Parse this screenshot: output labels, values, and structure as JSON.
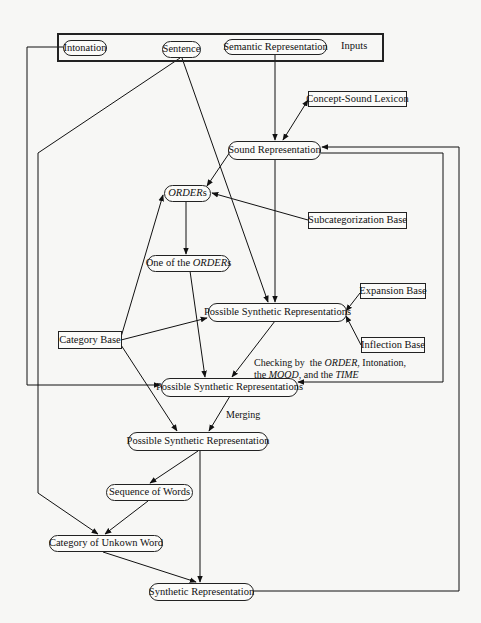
{
  "inputs_frame": {
    "label": "Inputs",
    "items": [
      "Intonation",
      "Sentence",
      "Semantic Representation"
    ]
  },
  "nodes": {
    "intonation": "Intonation",
    "sentence": "Sentence",
    "semantic_representation": "Semantic Representation",
    "concept_sound_lexicon": "Concept-Sound Lexicon",
    "sound_representation": "Sound Representation",
    "orders": {
      "italic": "ORDER",
      "suffix": "s"
    },
    "subcategorization_base": "Subcategorization Base",
    "one_of_orders": {
      "prefix": "One of the ",
      "italic": "ORDER",
      "suffix": "s"
    },
    "expansion_base": "Expansion Base",
    "possible_synthetic_representations_1": "Possible Synthetic Representations",
    "category_base": "Category Base",
    "inflection_base": "Inflection Base",
    "possible_synthetic_representations_2": "Possible Synthetic Representations",
    "possible_synthetic_representation": "Possible Synthetic Representation",
    "sequence_of_words": "Sequence of Words",
    "category_of_unknown_word": "Category of Unkown Word",
    "synthetic_representation": "Synthetic Representation"
  },
  "edge_labels": {
    "checking": {
      "line1_a": "Checking by  the ",
      "line1_order": "ORDER",
      "line1_b": ", Intonation,",
      "line2_a": "the ",
      "line2_mood": "MOOD",
      "line2_b": ", and the ",
      "line2_time": "TIME"
    },
    "merging": "Merging"
  },
  "edges": [
    {
      "from": "Semantic Representation",
      "to": "Sound Representation"
    },
    {
      "from": "Concept-Sound Lexicon",
      "to": "Sound Representation",
      "bidirectional": true
    },
    {
      "from": "Sound Representation",
      "to": "ORDERs"
    },
    {
      "from": "Sound Representation",
      "to": "Possible Synthetic Representations (1)"
    },
    {
      "from": "Subcategorization Base",
      "to": "ORDERs"
    },
    {
      "from": "ORDERs",
      "to": "One of the ORDERs"
    },
    {
      "from": "One of the ORDERs",
      "to": "Possible Synthetic Representations (2)"
    },
    {
      "from": "Sentence",
      "to": "Possible Synthetic Representations (1)"
    },
    {
      "from": "Sentence",
      "to": "Category of Unkown Word"
    },
    {
      "from": "Intonation",
      "to": "Possible Synthetic Representations (2)"
    },
    {
      "from": "Expansion Base",
      "to": "Possible Synthetic Representations (1)"
    },
    {
      "from": "Inflection Base",
      "to": "Possible Synthetic Representations (1)"
    },
    {
      "from": "Category Base",
      "to": "ORDERs"
    },
    {
      "from": "Category Base",
      "to": "Possible Synthetic Representations (1)"
    },
    {
      "from": "Category Base",
      "to": "Possible Synthetic Representation"
    },
    {
      "from": "Possible Synthetic Representations (1)",
      "to": "Possible Synthetic Representations (2)",
      "label": "Checking"
    },
    {
      "from": "Sound Representation",
      "to": "Possible Synthetic Representations (2)",
      "route": "right loop"
    },
    {
      "from": "Possible Synthetic Representations (2)",
      "to": "Possible Synthetic Representation",
      "label": "Merging"
    },
    {
      "from": "Possible Synthetic Representation",
      "to": "Sequence of Words"
    },
    {
      "from": "Possible Synthetic Representation",
      "to": "Synthetic Representation"
    },
    {
      "from": "Sequence of Words",
      "to": "Category of Unkown Word"
    },
    {
      "from": "Category of Unkown Word",
      "to": "Synthetic Representation"
    },
    {
      "from": "Synthetic Representation",
      "to": "Sound Representation",
      "route": "outer right loop"
    }
  ]
}
